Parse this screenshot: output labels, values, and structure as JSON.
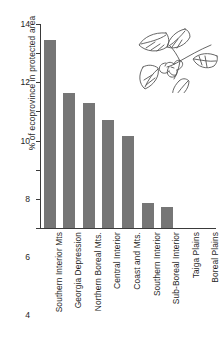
{
  "chart_data": {
    "type": "bar",
    "title": "",
    "subtitle": "",
    "xlabel": "",
    "ylabel": "% of ecoprovince in protected area",
    "categories": [
      "Southern Interior Mts",
      "Georgia Depression",
      "Northern Boreal Mts.",
      "Central Interior",
      "Coast and Mts.",
      "Southern Interior",
      "Sub-Boreal Interior",
      "Taiga Plains",
      "Boreal Plains"
    ],
    "values": [
      12.9,
      9.3,
      8.6,
      7.4,
      6.3,
      1.7,
      1.45,
      0,
      0
    ],
    "ylim": [
      0,
      14
    ],
    "yticks": [
      0,
      2,
      4,
      6,
      8,
      10,
      12,
      14
    ],
    "ytick_labels": [
      "0",
      "2",
      "4",
      "6",
      "8",
      "10",
      "12",
      "14"
    ],
    "grid": false,
    "legend": false,
    "legend_position": "none",
    "bar_color": "#767676",
    "axis_color": "#3a3a3a",
    "background_color": "#ffffff"
  },
  "decoration": {
    "illustration_name": "botanical-sprig-illustration",
    "description": "line drawing of a leafy branch with flower cluster",
    "line_color": "#555555"
  }
}
